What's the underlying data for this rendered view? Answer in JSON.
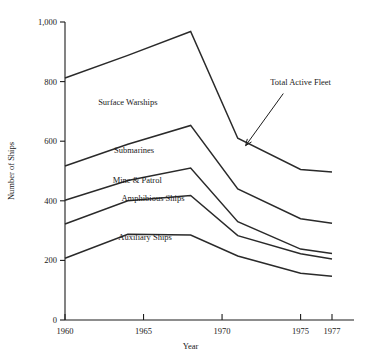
{
  "chart_data": {
    "type": "line",
    "title": "",
    "xlabel": "Year",
    "ylabel": "Number of Ships",
    "xlim": [
      1960,
      1977
    ],
    "ylim": [
      0,
      1000
    ],
    "grid": false,
    "legend_position": "inline-labels",
    "x_ticks": [
      1960,
      1965,
      1970,
      1975,
      1977
    ],
    "x_tick_labels": [
      "1960",
      "1965",
      "1970",
      "1975",
      "1977"
    ],
    "y_ticks": [
      0,
      200,
      400,
      600,
      800,
      1000
    ],
    "y_tick_labels": [
      "0",
      "200",
      "400",
      "600",
      "800",
      "1,000"
    ],
    "annotations": [
      {
        "text": "Total Active Fleet",
        "label_x": 1975.0,
        "label_y": 790,
        "arrow_from_x": 1973.9,
        "arrow_from_y": 760,
        "arrow_to_x": 1971.5,
        "arrow_to_y": 585
      }
    ],
    "series": [
      {
        "name": "Total Active Fleet",
        "label": "Surface Warships",
        "label_x": 1964.0,
        "label_y": 720,
        "x": [
          1960,
          1964,
          1968,
          1971,
          1975,
          1977
        ],
        "values": [
          812,
          888,
          968,
          610,
          505,
          497
        ]
      },
      {
        "name": "Submarines boundary",
        "label": "Submarines",
        "label_x": 1964.4,
        "label_y": 560,
        "x": [
          1960,
          1964,
          1968,
          1971,
          1975,
          1977
        ],
        "values": [
          517,
          590,
          653,
          440,
          340,
          325
        ]
      },
      {
        "name": "Mine & Patrol boundary",
        "label": "Mine & Patrol",
        "label_x": 1964.6,
        "label_y": 460,
        "x": [
          1960,
          1964,
          1968,
          1971,
          1975,
          1977
        ],
        "values": [
          402,
          468,
          510,
          330,
          238,
          223
        ]
      },
      {
        "name": "Amphibious Ships boundary",
        "label": "Amphibious Ships",
        "label_x": 1965.6,
        "label_y": 400,
        "x": [
          1960,
          1964,
          1968,
          1971,
          1975,
          1977
        ],
        "values": [
          322,
          400,
          418,
          283,
          222,
          205
        ]
      },
      {
        "name": "Auxiliary Ships boundary",
        "label": "Auxiliary Ships",
        "label_x": 1965.1,
        "label_y": 268,
        "x": [
          1960,
          1964,
          1968,
          1971,
          1975,
          1977
        ],
        "values": [
          207,
          288,
          285,
          215,
          157,
          147
        ]
      }
    ]
  }
}
